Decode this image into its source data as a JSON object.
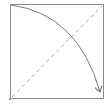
{
  "diagram": {
    "frame": {
      "x": 10,
      "y": 4,
      "width": 94,
      "height": 95,
      "stroke": "#8a8a8a"
    },
    "dashed_diagonal": {
      "from": [
        12,
        97
      ],
      "to": [
        102,
        6
      ],
      "stroke": "#a0a0a0",
      "dash": "4,3"
    },
    "curved_arrow": {
      "from": [
        11,
        5
      ],
      "to": [
        100,
        93
      ],
      "stroke": "#7a7a7a"
    },
    "corner_marker": {
      "x": 10,
      "y": 99,
      "color": "#9a9a9a"
    }
  }
}
